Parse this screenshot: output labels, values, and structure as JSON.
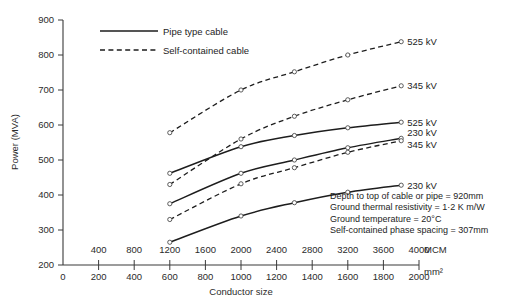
{
  "chart_data": {
    "type": "line",
    "title": "",
    "xlabel": "Conductor size",
    "ylabel": "Power (MVA)",
    "ylim": [
      200,
      900
    ],
    "yticks": [
      200,
      300,
      400,
      500,
      600,
      700,
      800,
      900
    ],
    "x_axis_primary": {
      "unit": "MCM",
      "unit_label": "MCM",
      "ticks": [
        400,
        800,
        1200,
        1600,
        2000,
        2400,
        2800,
        3200,
        3600,
        4000
      ]
    },
    "x_axis_secondary": {
      "unit": "mm2",
      "unit_label": "mm²",
      "ticks": [
        0,
        200,
        400,
        600,
        800,
        1000,
        1200,
        1400,
        1600,
        1800,
        2000
      ]
    },
    "xlim_mm2": [
      0,
      2000
    ],
    "grid": false,
    "legend_position": "top-center",
    "legend": [
      {
        "label": "Pipe type cable",
        "style": "solid"
      },
      {
        "label": "Self-contained cable",
        "style": "dashed"
      }
    ],
    "series": [
      {
        "name": "525 kV",
        "style": "dashed",
        "cable_type": "Self-contained cable",
        "end_label": "525 kV",
        "x_mm2": [
          600,
          1000,
          1300,
          1600,
          1900
        ],
        "values": [
          578,
          700,
          752,
          800,
          838
        ]
      },
      {
        "name": "345 kV",
        "style": "dashed",
        "cable_type": "Self-contained cable",
        "end_label": "345 kV",
        "x_mm2": [
          600,
          1000,
          1300,
          1600,
          1900
        ],
        "values": [
          430,
          560,
          625,
          672,
          712
        ]
      },
      {
        "name": "525 kV",
        "style": "solid",
        "cable_type": "Pipe type cable",
        "end_label": "525 kV",
        "x_mm2": [
          600,
          1000,
          1300,
          1600,
          1900
        ],
        "values": [
          462,
          538,
          570,
          592,
          608
        ]
      },
      {
        "name": "230 kV",
        "style": "solid",
        "cable_type": "Pipe type cable",
        "end_label": "230 kV",
        "x_mm2": [
          600,
          1000,
          1300,
          1600,
          1900
        ],
        "values": [
          375,
          462,
          500,
          535,
          562
        ]
      },
      {
        "name": "345 kV",
        "style": "dashed",
        "cable_type": "Self-contained cable",
        "end_label": "345 kV",
        "x_mm2": [
          600,
          1000,
          1300,
          1600,
          1900
        ],
        "values": [
          330,
          432,
          478,
          522,
          555
        ]
      },
      {
        "name": "230 kV",
        "style": "solid",
        "cable_type": "Pipe type cable",
        "end_label": "230 kV",
        "x_mm2": [
          600,
          1000,
          1300,
          1600,
          1900
        ],
        "values": [
          265,
          340,
          378,
          408,
          428
        ]
      }
    ],
    "annotations": [
      "Depth to top of cable or pipe  =  920mm",
      "Ground thermal resistivity  =  1·2 K m/W",
      "Ground temperature  =  20°C",
      "Self-contained phase spacing  =  307mm"
    ]
  }
}
